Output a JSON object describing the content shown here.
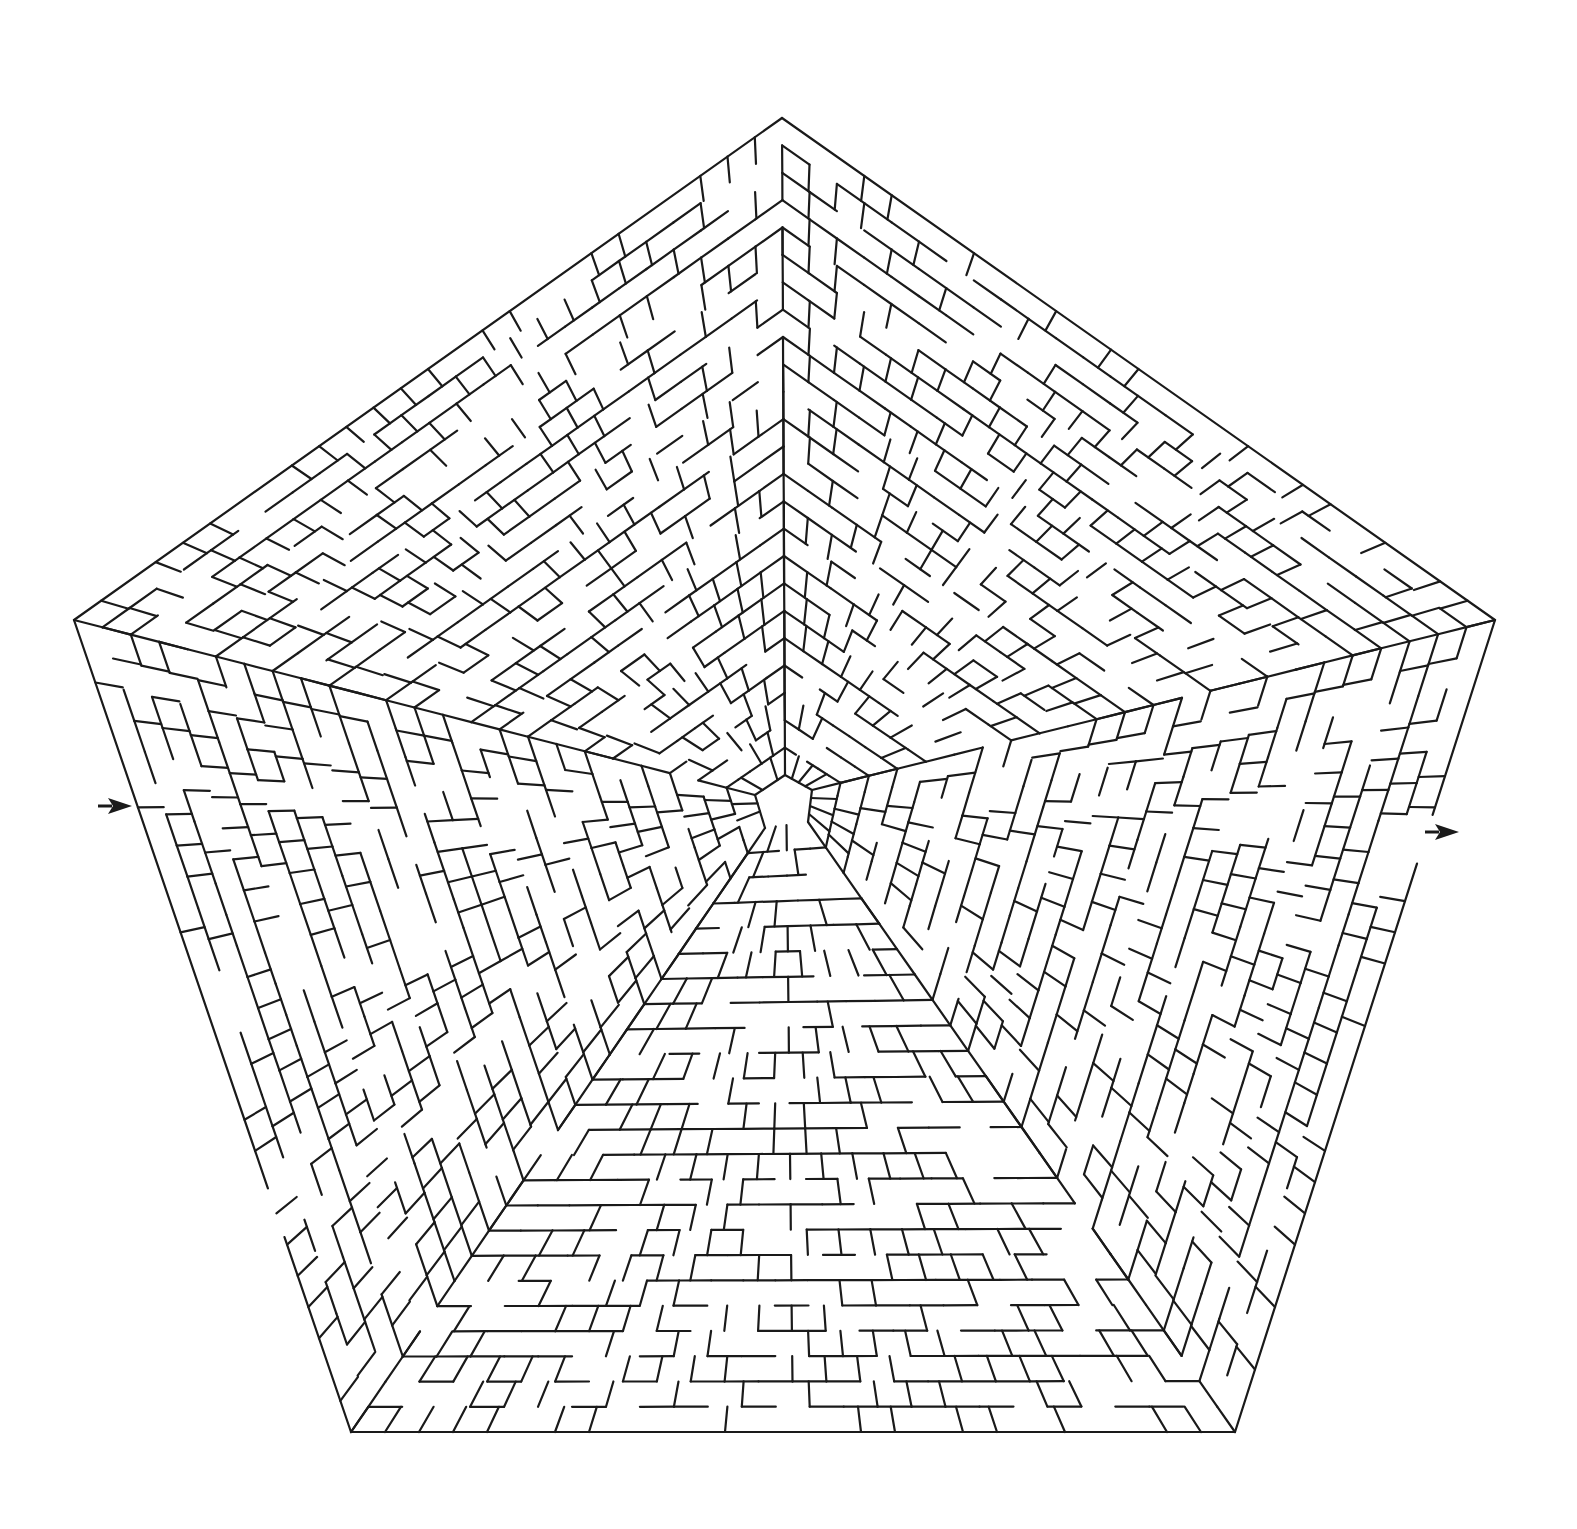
{
  "puzzle": {
    "type": "pentagon-maze",
    "background_color": "#ffffff",
    "wall_color": "#1a1a1a",
    "wall_width": 2.2,
    "center": [
      785,
      800
    ],
    "outer_vertices": [
      [
        782,
        118
      ],
      [
        1495,
        620
      ],
      [
        1235,
        1432
      ],
      [
        351,
        1432
      ],
      [
        74,
        620
      ]
    ],
    "inner_core_vertices": [
      [
        785,
        775
      ],
      [
        812,
        790
      ],
      [
        808,
        822
      ],
      [
        765,
        828
      ],
      [
        755,
        795
      ]
    ],
    "ring_count": 24,
    "radial_density": 0.55,
    "ring_wall_probability": 0.68,
    "seed": 20240611
  },
  "entrance": {
    "label": "",
    "arrow_icon": "right-arrow-icon",
    "position": [
      98,
      798
    ],
    "gap_edge": "left",
    "gap_t": [
      0.7,
      0.76
    ]
  },
  "exit": {
    "label": "",
    "arrow_icon": "right-arrow-icon",
    "position": [
      1425,
      824
    ],
    "gap_edge": "right",
    "gap_t": [
      0.24,
      0.3
    ]
  }
}
